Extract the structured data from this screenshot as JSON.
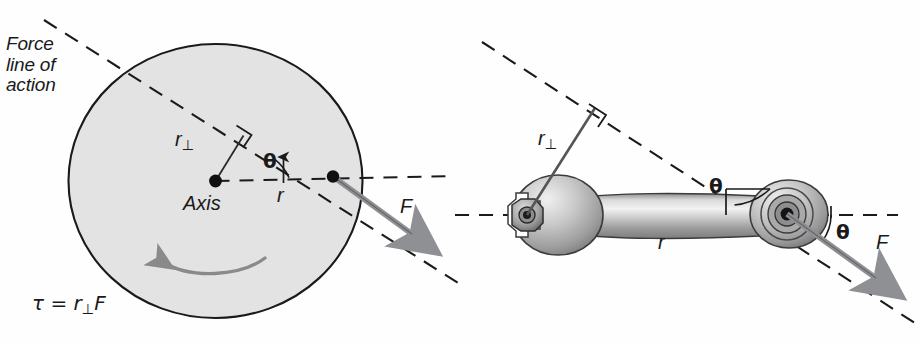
{
  "figure": {
    "background_color": "#fefefe",
    "ink_color": "#1a1a1a",
    "disk_fill_color": "#e3e3e3",
    "force_arrow_color": "#8f9094",
    "rotation_arrow_color": "#8a8a8a",
    "metal_light_color": "#f0f0f0",
    "metal_mid_color": "#b9b9b9",
    "metal_dark_color": "#6e6e6e"
  },
  "left_panel": {
    "name": "rotating-disk-panel",
    "force_line_label": {
      "line1": "Force",
      "line2": "line of",
      "line3": "action"
    },
    "axis_label": "Axis",
    "perp_radius_label": "r",
    "perp_radius_subscript": "⊥",
    "radius_label": "r",
    "angle_label": "θ",
    "force_label": "F",
    "equation": {
      "tau": "τ",
      "equals": "=",
      "r": "r",
      "subscript": "⊥",
      "F": "F",
      "full_text": "τ = r⊥F"
    },
    "rotation_sense": "counterclockwise"
  },
  "right_panel": {
    "name": "wrench-panel",
    "perp_radius_label": "r",
    "perp_radius_subscript": "⊥",
    "radius_label": "r",
    "angle_label_upper": "θ",
    "angle_label_lower": "θ",
    "force_label": "F",
    "tool": "open-end-and-ring-wrench",
    "nut": "hex-nut"
  },
  "icons": {
    "right_angle_marker": "right-angle-icon",
    "pivot_dot": "pivot-point-icon",
    "application_dot": "force-application-point-icon",
    "force_arrow": "force-arrow-icon",
    "rotation_arrow": "rotation-arrow-icon"
  }
}
